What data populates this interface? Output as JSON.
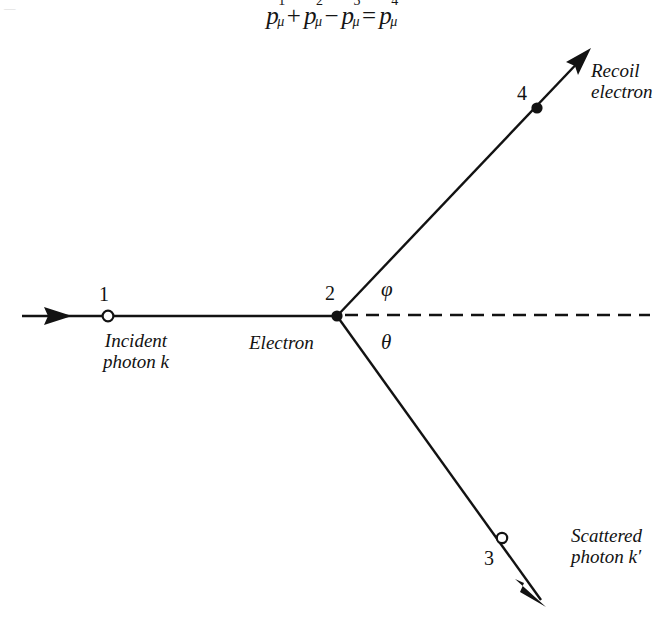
{
  "figure": {
    "kind": "feynman-style-kinematics-diagram",
    "equation": {
      "terms": [
        {
          "base": "p",
          "sup": "1",
          "sub": "μ",
          "op_before": ""
        },
        {
          "base": "p",
          "sup": "2",
          "sub": "μ",
          "op_before": "+"
        },
        {
          "base": "p",
          "sup": "3",
          "sub": "μ",
          "op_before": "−"
        },
        {
          "base": "p",
          "sup": "4",
          "sub": "μ",
          "op_before": "="
        }
      ],
      "plain": "p¹μ + p²μ − p³μ = p⁴μ"
    },
    "vertex_label": "Electron",
    "points": [
      {
        "id": "1",
        "number": "1",
        "marker": "open-circle",
        "x": 108,
        "y": 316
      },
      {
        "id": "2",
        "number": "2",
        "marker": "filled-dot",
        "x": 337,
        "y": 316
      },
      {
        "id": "3",
        "number": "3",
        "marker": "open-circle",
        "x": 502,
        "y": 538
      },
      {
        "id": "4",
        "number": "4",
        "marker": "filled-dot",
        "x": 537,
        "y": 108
      }
    ],
    "lines": [
      {
        "name": "incident-photon-line",
        "style": "solid",
        "arrow": "mid-right",
        "from": [
          22,
          316
        ],
        "to": [
          337,
          316
        ]
      },
      {
        "name": "recoil-electron-line",
        "style": "solid",
        "arrow": "end",
        "from": [
          337,
          316
        ],
        "to": [
          590,
          50
        ]
      },
      {
        "name": "scattered-photon-line",
        "style": "solid",
        "arrow": "end",
        "from": [
          337,
          316
        ],
        "to": [
          545,
          605
        ]
      },
      {
        "name": "reference-axis-line",
        "style": "dashed",
        "arrow": "none",
        "from": [
          337,
          316
        ],
        "to": [
          650,
          315
        ]
      }
    ],
    "labels": {
      "incident": {
        "line1": "Incident",
        "line2": "photon k"
      },
      "electron": "Electron",
      "recoil": {
        "line1": "Recoil",
        "line2": "electron"
      },
      "scattered": {
        "line1": "Scattered",
        "line2": "photon k′"
      },
      "angle_phi": "φ",
      "angle_theta": "θ"
    },
    "colors": {
      "ink": "#121212",
      "background": "#ffffff"
    },
    "scan_artifact": "—"
  }
}
